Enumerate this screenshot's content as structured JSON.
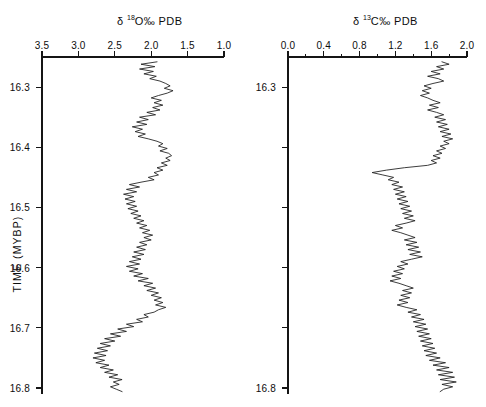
{
  "figure": {
    "width": 486,
    "height": 407,
    "background": "#ffffff",
    "ink_color": "#151515",
    "y_axis_title": "TIME (MYBP)"
  },
  "chart_data": [
    {
      "type": "line",
      "panel": "left",
      "title": "δ 18O‰ PDB",
      "title_parts": {
        "delta": "δ",
        "superscript": "18",
        "rest": "O‰ PDB"
      },
      "xlabel": "δ 18O‰ PDB",
      "ylabel": "TIME (MYBP)",
      "xlim": [
        3.5,
        1.0
      ],
      "ylim": [
        16.8,
        16.25
      ],
      "x_inverted": true,
      "y_inverted": true,
      "grid": false,
      "legend": null,
      "xticks": [
        3.5,
        3.0,
        2.5,
        2.0,
        1.5,
        1.0
      ],
      "xticklabels": [
        "3.5",
        "3.0",
        "2.5",
        "2.0",
        "1.5",
        "1.0"
      ],
      "yticks": [
        16.3,
        16.4,
        16.5,
        16.6,
        16.7,
        16.8
      ],
      "yticklabels": [
        "16.3",
        "16.4",
        "16.5",
        "16.6",
        "16.7",
        "16.8"
      ],
      "y": [
        16.258,
        16.262,
        16.266,
        16.27,
        16.274,
        16.278,
        16.282,
        16.286,
        16.29,
        16.294,
        16.298,
        16.302,
        16.306,
        16.31,
        16.314,
        16.318,
        16.322,
        16.326,
        16.33,
        16.334,
        16.338,
        16.342,
        16.346,
        16.35,
        16.354,
        16.358,
        16.362,
        16.366,
        16.37,
        16.374,
        16.378,
        16.382,
        16.386,
        16.39,
        16.394,
        16.398,
        16.402,
        16.406,
        16.41,
        16.414,
        16.418,
        16.422,
        16.426,
        16.43,
        16.434,
        16.438,
        16.442,
        16.446,
        16.45,
        16.454,
        16.458,
        16.462,
        16.466,
        16.47,
        16.474,
        16.478,
        16.482,
        16.486,
        16.49,
        16.494,
        16.498,
        16.502,
        16.506,
        16.51,
        16.514,
        16.518,
        16.522,
        16.526,
        16.53,
        16.534,
        16.538,
        16.542,
        16.546,
        16.55,
        16.554,
        16.558,
        16.562,
        16.566,
        16.57,
        16.574,
        16.578,
        16.582,
        16.586,
        16.59,
        16.594,
        16.598,
        16.602,
        16.606,
        16.61,
        16.614,
        16.618,
        16.622,
        16.626,
        16.63,
        16.634,
        16.638,
        16.642,
        16.646,
        16.65,
        16.654,
        16.658,
        16.662,
        16.666,
        16.67,
        16.674,
        16.678,
        16.682,
        16.686,
        16.69,
        16.694,
        16.698,
        16.702,
        16.706,
        16.71,
        16.714,
        16.718,
        16.722,
        16.726,
        16.73,
        16.734,
        16.738,
        16.742,
        16.746,
        16.75,
        16.754,
        16.758,
        16.762,
        16.766,
        16.77,
        16.774,
        16.778,
        16.782,
        16.786,
        16.79,
        16.794,
        16.798,
        16.802,
        16.806
      ],
      "values": [
        1.92,
        2.14,
        1.95,
        2.16,
        1.97,
        2.1,
        1.93,
        2.02,
        1.88,
        1.8,
        1.74,
        1.82,
        1.7,
        1.78,
        1.9,
        2.0,
        1.86,
        1.96,
        1.84,
        1.98,
        1.88,
        2.06,
        1.94,
        2.16,
        2.04,
        2.2,
        2.06,
        2.26,
        2.12,
        2.22,
        2.08,
        2.18,
        2.04,
        1.92,
        1.84,
        1.9,
        1.78,
        1.88,
        1.76,
        1.72,
        1.8,
        1.74,
        1.86,
        1.78,
        1.92,
        1.84,
        1.96,
        1.9,
        2.04,
        1.96,
        2.14,
        2.3,
        2.16,
        2.34,
        2.2,
        2.38,
        2.24,
        2.36,
        2.22,
        2.34,
        2.2,
        2.32,
        2.18,
        2.28,
        2.14,
        2.24,
        2.1,
        2.2,
        2.06,
        2.16,
        2.02,
        2.12,
        1.98,
        2.1,
        2.0,
        2.16,
        2.06,
        2.2,
        2.08,
        2.24,
        2.1,
        2.26,
        2.14,
        2.3,
        2.16,
        2.34,
        2.18,
        2.3,
        2.12,
        2.24,
        2.04,
        2.18,
        1.98,
        2.1,
        1.94,
        2.06,
        1.9,
        2.0,
        1.86,
        1.96,
        1.84,
        1.94,
        1.8,
        1.9,
        1.96,
        2.1,
        2.04,
        2.2,
        2.12,
        2.34,
        2.24,
        2.46,
        2.34,
        2.56,
        2.42,
        2.64,
        2.5,
        2.7,
        2.56,
        2.74,
        2.6,
        2.78,
        2.62,
        2.8,
        2.64,
        2.76,
        2.58,
        2.7,
        2.52,
        2.64,
        2.46,
        2.58,
        2.4,
        2.52,
        2.44,
        2.56,
        2.48,
        2.4
      ]
    },
    {
      "type": "line",
      "panel": "right",
      "title": "δ 13C‰ PDB",
      "title_parts": {
        "delta": "δ",
        "superscript": "13",
        "rest": "C‰ PDB"
      },
      "xlabel": "δ 13C‰ PDB",
      "ylabel": "TIME (MYBP)",
      "xlim": [
        0.0,
        2.0
      ],
      "ylim": [
        16.8,
        16.25
      ],
      "x_inverted": false,
      "y_inverted": true,
      "grid": false,
      "legend": null,
      "xticks": [
        0.0,
        0.2,
        0.4,
        0.6,
        0.8,
        1.0,
        1.2,
        1.4,
        1.6,
        1.8,
        2.0
      ],
      "xticklabels": [
        "0.0",
        "",
        "0.4",
        "",
        "0.8",
        "",
        "1.2",
        "",
        "1.6",
        "",
        "2.0"
      ],
      "xmajorticks": [
        0.0,
        0.4,
        0.8,
        1.2,
        1.6,
        2.0
      ],
      "yticks": [
        16.3,
        16.4,
        16.5,
        16.6,
        16.7,
        16.8
      ],
      "yticklabels": [
        "16.3",
        "",
        "",
        "",
        "",
        "16.8"
      ],
      "y": [
        16.258,
        16.262,
        16.266,
        16.27,
        16.274,
        16.278,
        16.282,
        16.286,
        16.29,
        16.294,
        16.298,
        16.302,
        16.306,
        16.31,
        16.314,
        16.318,
        16.322,
        16.326,
        16.33,
        16.334,
        16.338,
        16.342,
        16.346,
        16.35,
        16.354,
        16.358,
        16.362,
        16.366,
        16.37,
        16.374,
        16.378,
        16.382,
        16.386,
        16.39,
        16.394,
        16.398,
        16.402,
        16.406,
        16.41,
        16.414,
        16.418,
        16.422,
        16.426,
        16.43,
        16.434,
        16.438,
        16.442,
        16.446,
        16.45,
        16.454,
        16.458,
        16.462,
        16.466,
        16.47,
        16.474,
        16.478,
        16.482,
        16.486,
        16.49,
        16.494,
        16.498,
        16.502,
        16.506,
        16.51,
        16.514,
        16.518,
        16.522,
        16.526,
        16.53,
        16.534,
        16.538,
        16.542,
        16.546,
        16.55,
        16.554,
        16.558,
        16.562,
        16.566,
        16.57,
        16.574,
        16.578,
        16.582,
        16.586,
        16.59,
        16.594,
        16.598,
        16.602,
        16.606,
        16.61,
        16.614,
        16.618,
        16.622,
        16.626,
        16.63,
        16.634,
        16.638,
        16.642,
        16.646,
        16.65,
        16.654,
        16.658,
        16.662,
        16.666,
        16.67,
        16.674,
        16.678,
        16.682,
        16.686,
        16.69,
        16.694,
        16.698,
        16.702,
        16.706,
        16.71,
        16.714,
        16.718,
        16.722,
        16.726,
        16.73,
        16.734,
        16.738,
        16.742,
        16.746,
        16.75,
        16.754,
        16.758,
        16.762,
        16.766,
        16.77,
        16.774,
        16.778,
        16.782,
        16.786,
        16.79,
        16.794,
        16.798,
        16.802,
        16.806
      ],
      "values": [
        1.72,
        1.8,
        1.66,
        1.74,
        1.6,
        1.7,
        1.56,
        1.68,
        1.74,
        1.62,
        1.52,
        1.6,
        1.5,
        1.58,
        1.48,
        1.56,
        1.62,
        1.7,
        1.58,
        1.68,
        1.56,
        1.66,
        1.74,
        1.64,
        1.76,
        1.66,
        1.78,
        1.68,
        1.8,
        1.7,
        1.82,
        1.72,
        1.84,
        1.74,
        1.8,
        1.7,
        1.76,
        1.66,
        1.72,
        1.62,
        1.7,
        1.6,
        1.66,
        1.56,
        1.3,
        1.1,
        0.94,
        1.06,
        1.18,
        1.12,
        1.24,
        1.16,
        1.28,
        1.18,
        1.3,
        1.2,
        1.32,
        1.22,
        1.34,
        1.24,
        1.36,
        1.26,
        1.38,
        1.28,
        1.4,
        1.3,
        1.42,
        1.32,
        1.2,
        1.28,
        1.16,
        1.26,
        1.34,
        1.42,
        1.3,
        1.44,
        1.32,
        1.46,
        1.34,
        1.48,
        1.36,
        1.5,
        1.38,
        1.26,
        1.34,
        1.22,
        1.3,
        1.18,
        1.28,
        1.16,
        1.26,
        1.14,
        1.24,
        1.32,
        1.4,
        1.28,
        1.38,
        1.26,
        1.36,
        1.24,
        1.34,
        1.22,
        1.32,
        1.44,
        1.34,
        1.48,
        1.38,
        1.52,
        1.4,
        1.54,
        1.42,
        1.56,
        1.44,
        1.58,
        1.46,
        1.6,
        1.48,
        1.62,
        1.5,
        1.64,
        1.52,
        1.66,
        1.54,
        1.7,
        1.58,
        1.76,
        1.62,
        1.8,
        1.66,
        1.84,
        1.68,
        1.86,
        1.7,
        1.88,
        1.72,
        1.84,
        1.74,
        1.7
      ]
    }
  ]
}
